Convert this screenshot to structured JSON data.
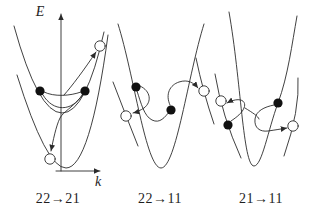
{
  "figure": {
    "background_color": "#ffffff",
    "stroke_color": "#2b2b2b",
    "axes": {
      "energy_label": "E",
      "momentum_label": "k"
    },
    "panels": [
      {
        "id": "22-21",
        "transition_label": "22→21"
      },
      {
        "id": "22-11",
        "transition_label": "22→11"
      },
      {
        "id": "21-11",
        "transition_label": "21→11"
      }
    ]
  }
}
